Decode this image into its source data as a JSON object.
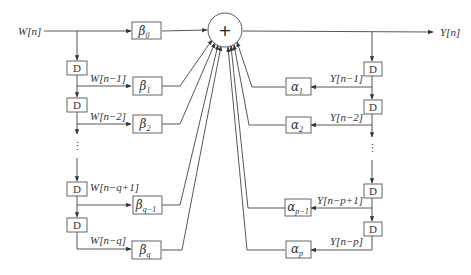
{
  "diagram": {
    "type": "ARMA filter block diagram (direct form)",
    "input_label": "W[n]",
    "output_label": "Y[n]",
    "summing_node": {
      "symbol": "+"
    },
    "delay_label": "D",
    "feedforward": {
      "taps": [
        {
          "coef": "β",
          "sub": "0",
          "signal": ""
        },
        {
          "coef": "β",
          "sub": "1",
          "signal": "W[n−1]"
        },
        {
          "coef": "β",
          "sub": "2",
          "signal": "W[n−2]"
        },
        {
          "coef": "β",
          "sub": "q−1",
          "signal": "W[n−q+1]"
        },
        {
          "coef": "β",
          "sub": "q",
          "signal": "W[n−q]"
        }
      ]
    },
    "feedback": {
      "taps": [
        {
          "coef": "α",
          "sub": "1",
          "signal": "Y[n−1]"
        },
        {
          "coef": "α",
          "sub": "2",
          "signal": "Y[n−2]"
        },
        {
          "coef": "α",
          "sub": "p−1",
          "signal": "Y[n−p+1]"
        },
        {
          "coef": "α",
          "sub": "p",
          "signal": "Y[n−p]"
        }
      ]
    },
    "ellipsis": "⋮",
    "colors": {
      "line": "#444444",
      "box_stroke": "#555555",
      "text": "#333333",
      "background": "#ffffff"
    }
  }
}
